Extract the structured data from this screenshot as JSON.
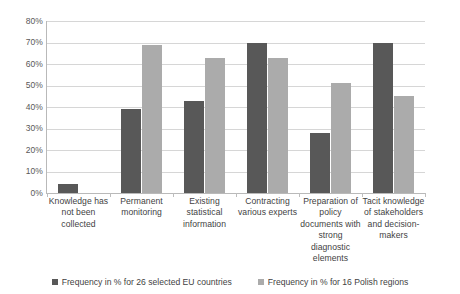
{
  "chart_data": {
    "type": "bar",
    "title": "",
    "xlabel": "",
    "ylabel": "",
    "ylim": [
      0,
      80
    ],
    "ytick_labels": [
      "80%",
      "70%",
      "60%",
      "50%",
      "40%",
      "30%",
      "20%",
      "10%",
      "0%"
    ],
    "ytick_values": [
      80,
      70,
      60,
      50,
      40,
      30,
      20,
      10,
      0
    ],
    "grid": true,
    "legend_position": "bottom",
    "categories": [
      "Knowledge has not been collected",
      "Permanent monitoring",
      "Existing statistical information",
      "Contracting various experts",
      "Preparation of policy documents with strong diagnostic elements",
      "Tacit knowledge of stakeholders and decision-makers"
    ],
    "series": [
      {
        "name": "Frequency in % for 26 selected EU countries",
        "color": "#585858",
        "values": [
          4,
          39,
          43,
          70,
          28,
          70
        ]
      },
      {
        "name": "Frequency in % for 16 Polish regions",
        "color": "#ababab",
        "values": [
          0,
          69,
          63,
          63,
          51,
          45
        ]
      }
    ]
  }
}
